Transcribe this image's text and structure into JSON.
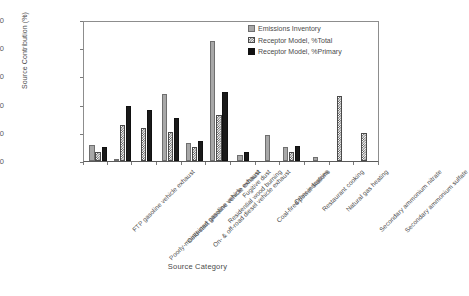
{
  "chart_data": {
    "type": "bar",
    "title": "",
    "xlabel": "Source Category",
    "ylabel": "Source Contribution (%)",
    "ylim": [
      0,
      50
    ],
    "yticks": [
      0,
      10,
      20,
      30,
      40,
      50
    ],
    "grid": false,
    "legend_position": "top-right",
    "categories": [
      "FTP gasoline vehicle exhaust",
      "Poorly-maintained gasoline vehicle exhaust",
      "Cold-start gasoline vehicle exhaust",
      "On- & off-road diesel vehicle exhaust",
      "Residential wood burning",
      "Fugitive dust",
      "Coal-fired power stations",
      "Other industries",
      "Restaurant cooking",
      "Natural gas heating",
      "Secondary ammonium nitrate",
      "Secondary ammonium sulfate"
    ],
    "series": [
      {
        "name": "Emissions Inventory",
        "color": "#a8a8a8",
        "pattern": "solid-gray",
        "values": [
          5.9,
          0.6,
          0.0,
          24.2,
          6.4,
          43.3,
          2.3,
          9.4,
          5.0,
          1.6,
          0.0,
          0.0
        ]
      },
      {
        "name": "Receptor Model, %Total",
        "color": "#4a4a4a",
        "pattern": "checkerboard",
        "values": [
          3.4,
          12.8,
          12.0,
          10.3,
          5.0,
          16.5,
          0.0,
          0.0,
          3.3,
          0.0,
          23.5,
          10.0
        ]
      },
      {
        "name": "Receptor Model, %Primary",
        "color": "#111111",
        "pattern": "solid-black",
        "values": [
          4.9,
          19.8,
          18.4,
          15.5,
          7.3,
          24.9,
          3.3,
          0.0,
          5.4,
          0.0,
          0.0,
          0.0
        ]
      }
    ]
  },
  "legend": {
    "entries": [
      "Emissions Inventory",
      "Receptor Model, %Total",
      "Receptor Model, %Primary"
    ]
  }
}
